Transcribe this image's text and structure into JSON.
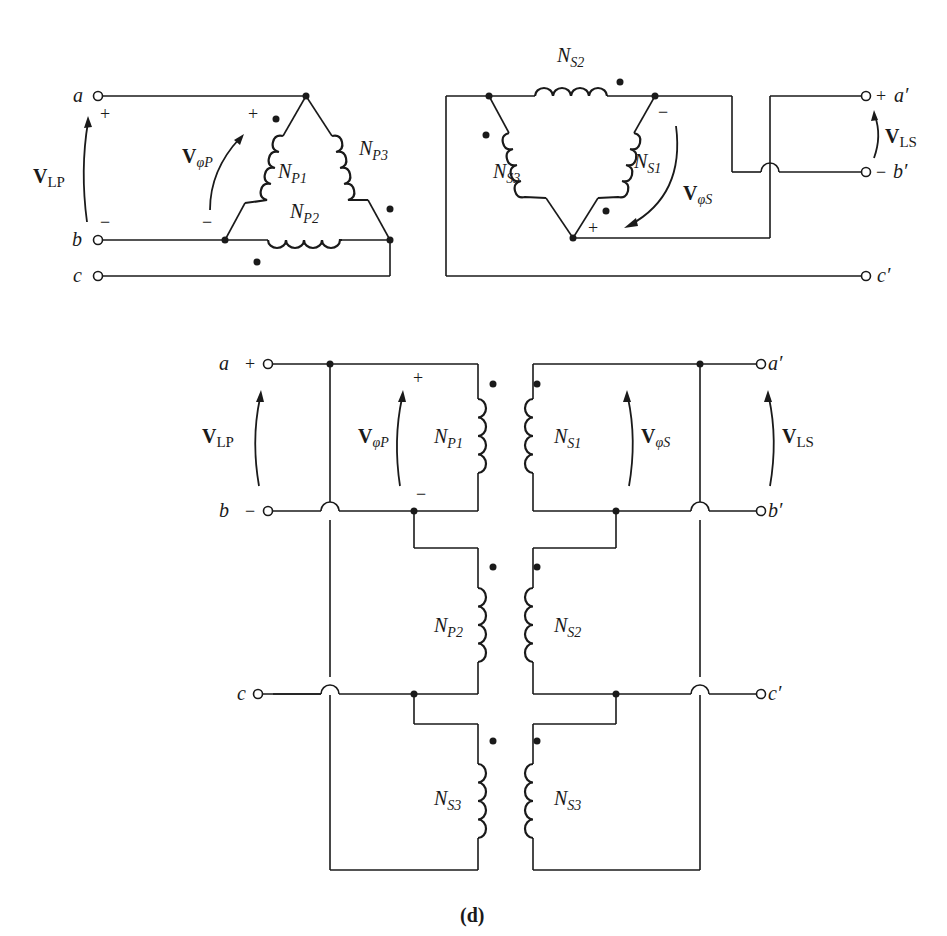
{
  "caption": "(d)",
  "colors": {
    "ink": "#1a1a1a",
    "background": "#ffffff"
  },
  "terminals": {
    "a": "a",
    "b": "b",
    "c": "c",
    "a_prime": "a′",
    "b_prime": "b′",
    "c_prime": "c′"
  },
  "signs": {
    "plus": "+",
    "minus": "−"
  },
  "voltages": {
    "V": "V",
    "LP_sub": "LP",
    "LS_sub": "LS",
    "phiP_sub": "φP",
    "phiS_sub": "φS"
  },
  "windings": {
    "N": "N",
    "P1": "P1",
    "P2": "P2",
    "P3": "P3",
    "S1": "S1",
    "S2": "S2",
    "S3": "S3"
  },
  "top_left": {
    "description": "Primary delta connection",
    "windings": [
      "NP1",
      "NP2",
      "NP3"
    ]
  },
  "top_right": {
    "description": "Secondary delta connection",
    "windings": [
      "NS1",
      "NS2",
      "NS3"
    ]
  },
  "bottom": {
    "description": "Delta-delta wiring diagram",
    "left_windings": [
      "NP1",
      "NP2",
      "NS3"
    ],
    "right_windings": [
      "NS1",
      "NS2",
      "NS3"
    ]
  }
}
